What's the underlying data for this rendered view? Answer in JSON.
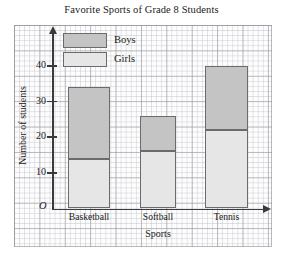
{
  "chart_data": {
    "type": "bar",
    "subtype": "stacked",
    "title": "Favorite Sports of Grade 8 Students",
    "xlabel": "Sports",
    "ylabel": "Number of students",
    "categories": [
      "Basketball",
      "Softball",
      "Tennis"
    ],
    "series": [
      {
        "name": "Girls",
        "values": [
          14,
          16,
          22
        ],
        "color": "#e6e6e6"
      },
      {
        "name": "Boys",
        "values": [
          20,
          10,
          18
        ],
        "color": "#c4c4c4"
      }
    ],
    "stack_tops": [
      34,
      26,
      40
    ],
    "ylim": [
      0,
      45
    ],
    "ytick_labels": [
      "10",
      "20",
      "30",
      "40"
    ],
    "ytick_values": [
      10,
      20,
      30,
      40
    ],
    "origin_label": "O",
    "grid": true,
    "legend_position": "top-left-inside",
    "legend_entries": [
      "Boys",
      "Girls"
    ],
    "axis_color": "#3a3a3a",
    "bar_outline_color": "#6b6b6b"
  },
  "legend": {
    "boys_label": "Boys",
    "girls_label": "Girls"
  }
}
